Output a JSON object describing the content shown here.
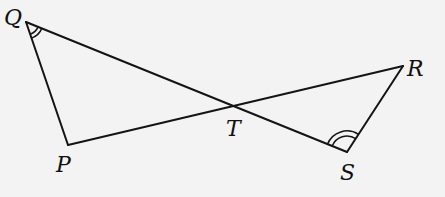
{
  "diagram": {
    "type": "geometry",
    "points": {
      "Q": {
        "label": "Q"
      },
      "P": {
        "label": "P"
      },
      "T": {
        "label": "T"
      },
      "S": {
        "label": "S"
      },
      "R": {
        "label": "R"
      }
    },
    "segments": [
      {
        "name": "QP",
        "from": "Q",
        "to": "P"
      },
      {
        "name": "QS",
        "from": "Q",
        "to": "S"
      },
      {
        "name": "PR",
        "from": "P",
        "to": "R"
      },
      {
        "name": "RS",
        "from": "R",
        "to": "S"
      }
    ],
    "intersection": {
      "point": "T",
      "of": [
        "QS",
        "PR"
      ]
    },
    "angle_marks": [
      {
        "vertex": "Q",
        "between": [
          "P",
          "S"
        ],
        "style": "double-arc"
      },
      {
        "vertex": "S",
        "between": [
          "Q",
          "R"
        ],
        "style": "double-arc"
      }
    ],
    "colors": {
      "background": "#f3f3f3",
      "stroke": "#141414",
      "text": "#111111"
    }
  }
}
